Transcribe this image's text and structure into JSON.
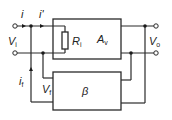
{
  "diagram": {
    "type": "circuit",
    "labels": {
      "input_current": "i",
      "amp_input_current": "i'",
      "input_voltage": "V",
      "input_voltage_sub": "i",
      "input_resistance": "R",
      "input_resistance_sub": "i",
      "amp_gain": "A",
      "amp_gain_sub": "v",
      "output_voltage": "V",
      "output_voltage_sub": "o",
      "feedback_current": "i",
      "feedback_current_sub": "f",
      "feedback_voltage": "V",
      "feedback_voltage_sub": "f",
      "feedback_network": "β"
    },
    "blocks": [
      {
        "id": "amplifier",
        "label": "A_v",
        "contains": "R_i"
      },
      {
        "id": "feedback",
        "label": "β"
      }
    ]
  }
}
